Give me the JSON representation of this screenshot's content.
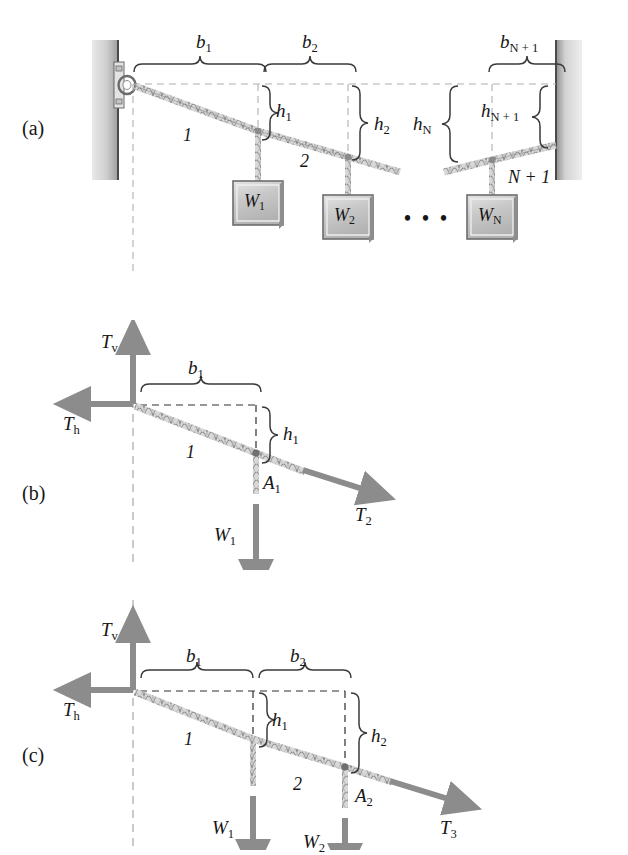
{
  "figure": {
    "background_color": "#ffffff",
    "rope_color": "#9a9a9a",
    "arrow_color": "#8c8c8c",
    "dash_color": "#a8a8a8",
    "weight_box_fill": "#c9c9c9",
    "ink_color": "#161616"
  },
  "panels": [
    {
      "tag": "(a)",
      "description": "Full cable spanning from left wall anchor to right wall with N weights",
      "spans": [
        "b1",
        "b2",
        "bN+1"
      ],
      "drops": [
        "h1",
        "h2",
        "hN",
        "hN+1"
      ],
      "segments": [
        "1",
        "2",
        "N + 1"
      ],
      "weights": [
        "W1",
        "W2",
        "WN"
      ],
      "ellipsis": "• • •"
    },
    {
      "tag": "(b)",
      "description": "Free body diagram cutting after the first weight",
      "reactions": [
        "Tv",
        "Th"
      ],
      "spans": [
        "b1"
      ],
      "drops": [
        "h1"
      ],
      "segments": [
        "1"
      ],
      "nodes": [
        "A1"
      ],
      "weights": [
        "W1"
      ],
      "tensions": [
        "T2"
      ]
    },
    {
      "tag": "(c)",
      "description": "Free body diagram cutting after the second weight",
      "reactions": [
        "Tv",
        "Th"
      ],
      "spans": [
        "b1",
        "b2"
      ],
      "drops": [
        "h1",
        "h2"
      ],
      "segments": [
        "1",
        "2"
      ],
      "nodes": [
        "A2"
      ],
      "weights": [
        "W1",
        "W2"
      ],
      "tensions": [
        "T3"
      ]
    }
  ],
  "labels": {
    "panel_a": "(a)",
    "panel_b": "(b)",
    "panel_c": "(c)",
    "b_1": "b",
    "b_1_sub": "1",
    "b_2": "b",
    "b_2_sub": "2",
    "b_Np1": "b",
    "b_Np1_sub": "N + 1",
    "h_1": "h",
    "h_1_sub": "1",
    "h_2": "h",
    "h_2_sub": "2",
    "h_N": "h",
    "h_N_sub": "N",
    "h_Np1": "h",
    "h_Np1_sub": "N + 1",
    "seg_1": "1",
    "seg_2": "2",
    "seg_Np1": "N + 1",
    "W_1": "W",
    "W_1_sub": "1",
    "W_2": "W",
    "W_2_sub": "2",
    "W_N": "W",
    "W_N_sub": "N",
    "T_v": "T",
    "T_v_sub": "v",
    "T_h": "T",
    "T_h_sub": "h",
    "T_2": "T",
    "T_2_sub": "2",
    "T_3": "T",
    "T_3_sub": "3",
    "A_1": "A",
    "A_1_sub": "1",
    "A_2": "A",
    "A_2_sub": "2",
    "ellipsis": "• • •"
  }
}
